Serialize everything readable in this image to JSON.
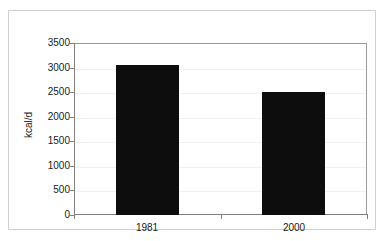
{
  "figure": {
    "background_color": "#ffffff",
    "frame_border_color": "#cfcfcf",
    "plot_border_color": "#9b9b9b",
    "title_remnant": "",
    "bar_color": "#0d0d0d",
    "gridline_color": "#f2f2f2"
  },
  "chart_data": {
    "type": "bar",
    "title": "",
    "xlabel": "",
    "ylabel": "kcal/d",
    "categories": [
      "1981",
      "2000"
    ],
    "values": [
      3060,
      2500
    ],
    "series": [
      {
        "name": "Energy intake",
        "values": [
          3060,
          2500
        ]
      }
    ],
    "ylim": [
      0,
      3500
    ],
    "yticks": [
      0,
      500,
      1000,
      1500,
      2000,
      2500,
      3000,
      3500
    ],
    "ytick_labels": [
      "0",
      "500",
      "1000",
      "1500",
      "2000",
      "2500",
      "3000",
      "3500"
    ],
    "grid": true,
    "legend": false,
    "legend_position": "none",
    "annotations": []
  }
}
